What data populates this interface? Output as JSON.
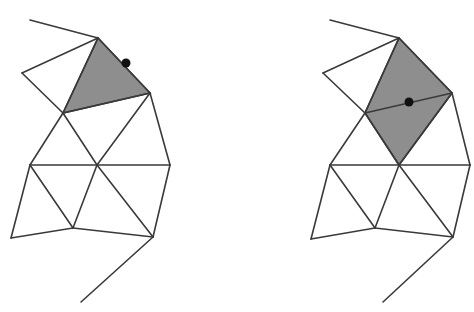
{
  "diagram": {
    "type": "triangle-mesh-edge-flip",
    "colors": {
      "edge": "#3a3a3a",
      "shaded": "#8e8e8e",
      "point": "#111111",
      "background": "#ffffff"
    },
    "panels": [
      {
        "name": "left-mesh",
        "description": "Mesh with shaded triangle and a point on its boundary edge",
        "vertices": {
          "A": [
            30,
            20
          ],
          "B": [
            98,
            38
          ],
          "C": [
            22,
            73
          ],
          "D": [
            150,
            93
          ],
          "E": [
            63,
            113
          ],
          "F": [
            30,
            165
          ],
          "G": [
            97,
            165
          ],
          "H": [
            170,
            165
          ],
          "I": [
            11,
            238
          ],
          "J": [
            73,
            228
          ],
          "K": [
            153,
            237
          ],
          "L": [
            81,
            302
          ]
        },
        "edges": [
          [
            "A",
            "B"
          ],
          [
            "B",
            "C"
          ],
          [
            "C",
            "E"
          ],
          [
            "B",
            "E"
          ],
          [
            "B",
            "D"
          ],
          [
            "E",
            "D"
          ],
          [
            "E",
            "F"
          ],
          [
            "E",
            "G"
          ],
          [
            "D",
            "G"
          ],
          [
            "D",
            "H"
          ],
          [
            "F",
            "G"
          ],
          [
            "G",
            "H"
          ],
          [
            "F",
            "I"
          ],
          [
            "F",
            "J"
          ],
          [
            "G",
            "J"
          ],
          [
            "G",
            "K"
          ],
          [
            "H",
            "K"
          ],
          [
            "I",
            "J"
          ],
          [
            "J",
            "K"
          ],
          [
            "K",
            "L"
          ]
        ],
        "shaded": [
          [
            "B",
            "D",
            "E"
          ]
        ],
        "point": [
          126,
          63
        ]
      },
      {
        "name": "right-mesh",
        "description": "Mesh with shaded quadrilateral (two triangles) and a point on the shared interior edge",
        "vertices": {
          "A": [
            330,
            20
          ],
          "B": [
            399,
            38
          ],
          "C": [
            323,
            73
          ],
          "D": [
            452,
            93
          ],
          "E": [
            365,
            113
          ],
          "F": [
            330,
            165
          ],
          "G": [
            399,
            165
          ],
          "H": [
            470,
            165
          ],
          "I": [
            311,
            239
          ],
          "J": [
            375,
            228
          ],
          "K": [
            453,
            237
          ],
          "L": [
            383,
            302
          ]
        },
        "edges": [
          [
            "A",
            "B"
          ],
          [
            "B",
            "C"
          ],
          [
            "C",
            "E"
          ],
          [
            "B",
            "E"
          ],
          [
            "B",
            "D"
          ],
          [
            "E",
            "D"
          ],
          [
            "E",
            "F"
          ],
          [
            "E",
            "G"
          ],
          [
            "D",
            "G"
          ],
          [
            "D",
            "H"
          ],
          [
            "F",
            "G"
          ],
          [
            "G",
            "H"
          ],
          [
            "F",
            "I"
          ],
          [
            "F",
            "J"
          ],
          [
            "G",
            "J"
          ],
          [
            "G",
            "K"
          ],
          [
            "H",
            "K"
          ],
          [
            "I",
            "J"
          ],
          [
            "J",
            "K"
          ],
          [
            "K",
            "L"
          ]
        ],
        "shaded": [
          [
            "B",
            "D",
            "G",
            "E"
          ]
        ],
        "point": [
          409,
          102
        ]
      }
    ]
  }
}
